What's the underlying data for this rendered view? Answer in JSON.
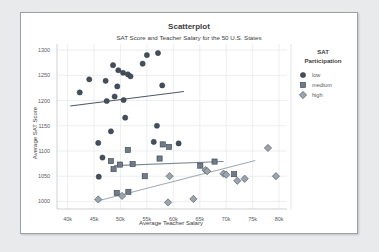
{
  "card": {
    "background_color": "#ffffff",
    "border_color": "#9aa0a6",
    "page_background": "#e9eaec"
  },
  "chart_data": {
    "type": "scatter",
    "title": "Scatterplot",
    "subtitle": "SAT Score and Teacher Salary for the 50 U.S. States",
    "xlabel": "Average Teacher Salary",
    "ylabel": "Average SAT Score",
    "xlim": [
      38000,
      81500
    ],
    "ylim": [
      985,
      1312
    ],
    "xticks": [
      40000,
      45000,
      50000,
      55000,
      60000,
      65000,
      70000,
      75000,
      80000
    ],
    "xticklabels": [
      "40k",
      "45k",
      "50k",
      "55k",
      "60k",
      "65k",
      "70k",
      "75k",
      "80k"
    ],
    "yticks": [
      1000,
      1050,
      1100,
      1150,
      1200,
      1250,
      1300
    ],
    "yticklabels": [
      "1000",
      "1050",
      "1100",
      "1150",
      "1200",
      "1250",
      "1300"
    ],
    "grid": true,
    "legend": {
      "title": "SAT Participation",
      "title_line1": "SAT",
      "title_line2": "Participation",
      "position": "right",
      "entries": [
        {
          "label": "low",
          "marker": "circle",
          "color": "#454f5b"
        },
        {
          "label": "medium",
          "marker": "square",
          "color": "#6f7b88"
        },
        {
          "label": "high",
          "marker": "diamond",
          "color": "#9aa4ad"
        }
      ]
    },
    "series": [
      {
        "name": "low",
        "marker": "circle",
        "color": "#454f5b",
        "points": [
          [
            42300,
            1216
          ],
          [
            44100,
            1242
          ],
          [
            47200,
            1239
          ],
          [
            48600,
            1270
          ],
          [
            49600,
            1260
          ],
          [
            50500,
            1255
          ],
          [
            51400,
            1252
          ],
          [
            51900,
            1248
          ],
          [
            49400,
            1228
          ],
          [
            48900,
            1208
          ],
          [
            50600,
            1201
          ],
          [
            47400,
            1199
          ],
          [
            54200,
            1273
          ],
          [
            55000,
            1290
          ],
          [
            57100,
            1294
          ],
          [
            57900,
            1230
          ],
          [
            50900,
            1166
          ],
          [
            48200,
            1139
          ],
          [
            56900,
            1150
          ],
          [
            45800,
            1116
          ],
          [
            46600,
            1087
          ],
          [
            45900,
            1049
          ],
          [
            56300,
            1118
          ],
          [
            61000,
            1115
          ]
        ],
        "trend": {
          "x1": 40500,
          "y1": 1189,
          "x2": 62000,
          "y2": 1218,
          "color": "#4d5864"
        }
      },
      {
        "name": "medium",
        "marker": "square",
        "color": "#6f7b88",
        "points": [
          [
            48200,
            1080
          ],
          [
            48700,
            1064
          ],
          [
            49900,
            1073
          ],
          [
            51400,
            1102
          ],
          [
            52300,
            1074
          ],
          [
            54600,
            1050
          ],
          [
            57400,
            1085
          ],
          [
            58000,
            1113
          ],
          [
            59200,
            1108
          ],
          [
            65100,
            1071
          ],
          [
            67800,
            1079
          ],
          [
            49300,
            1017
          ],
          [
            51500,
            1019
          ],
          [
            71500,
            1054
          ]
        ],
        "trend": {
          "x1": 48800,
          "y1": 1071,
          "x2": 69500,
          "y2": 1079,
          "color": "#7d8892"
        }
      },
      {
        "name": "high",
        "marker": "diamond",
        "color": "#9aa4ad",
        "points": [
          [
            45800,
            1004
          ],
          [
            50300,
            1011
          ],
          [
            59000,
            998
          ],
          [
            63800,
            1005
          ],
          [
            59300,
            1050
          ],
          [
            66100,
            1062
          ],
          [
            66400,
            1060
          ],
          [
            69500,
            1055
          ],
          [
            72100,
            1041
          ],
          [
            70000,
            1053
          ],
          [
            77900,
            1106
          ],
          [
            79400,
            1050
          ],
          [
            73500,
            1045
          ]
        ],
        "trend": {
          "x1": 46000,
          "y1": 1002,
          "x2": 75500,
          "y2": 1081,
          "color": "#a2abb3"
        }
      }
    ]
  }
}
